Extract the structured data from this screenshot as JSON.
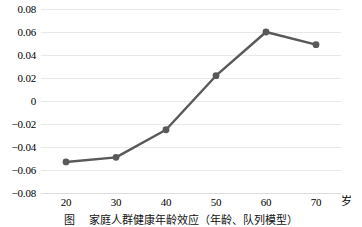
{
  "chart_data": {
    "type": "line",
    "title": "",
    "subtitle": "",
    "xlabel": "",
    "ylabel": "",
    "x_unit": "岁",
    "x": [
      20,
      30,
      40,
      50,
      60,
      70
    ],
    "categories": [
      "20",
      "30",
      "40",
      "50",
      "60",
      "70"
    ],
    "values": [
      -0.053,
      -0.049,
      -0.025,
      0.022,
      0.06,
      0.049
    ],
    "series": [
      {
        "name": "",
        "values": [
          -0.053,
          -0.049,
          -0.025,
          0.022,
          0.06,
          0.049
        ]
      }
    ],
    "xlim": [
      15,
      75
    ],
    "ylim": [
      -0.08,
      0.08
    ],
    "y_ticks": [
      0.08,
      0.06,
      0.04,
      0.02,
      0,
      -0.02,
      -0.04,
      -0.06,
      -0.08
    ],
    "y_tick_labels": [
      "0.08",
      "0.06",
      "0.04",
      "0.02",
      "0",
      "-0.02",
      "-0.04",
      "-0.06",
      "-0.08"
    ],
    "x_ticks": [
      20,
      30,
      40,
      50,
      60,
      70
    ],
    "x_tick_labels": [
      "20",
      "30",
      "40",
      "50",
      "60",
      "70"
    ],
    "grid": "horizontal",
    "legend": "none",
    "marker": "circle",
    "line_color": "#595959",
    "marker_color": "#595959",
    "grid_color": "#e8e8e8",
    "background_color": "#ffffff"
  },
  "caption": {
    "label": "图",
    "text": "家庭人群健康年龄效应（年龄、队列模型）"
  }
}
